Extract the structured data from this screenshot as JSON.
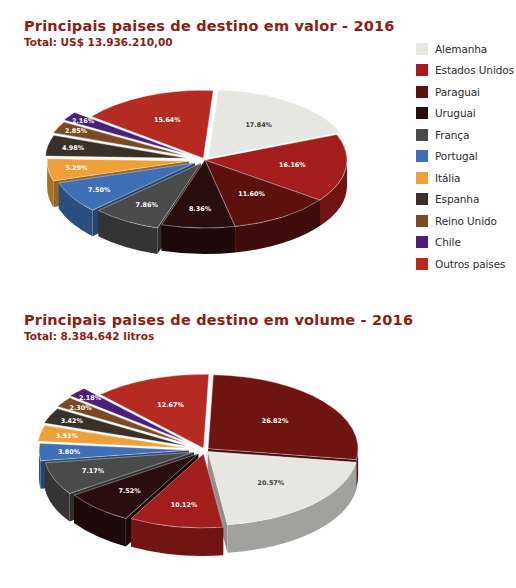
{
  "chart_data": [
    {
      "type": "pie",
      "title": "Principais paises de destino em valor - 2016",
      "subtitle": "Total: US$ 13.936.210,00",
      "legend_position": "right",
      "categories": [
        "Alemanha",
        "Estados Unidos",
        "Paraguai",
        "Uruguai",
        "França",
        "Portugal",
        "Itália",
        "Espanha",
        "Reino Unido",
        "Chile",
        "Outros paises"
      ],
      "values": [
        17.84,
        16.16,
        11.6,
        8.36,
        7.86,
        7.5,
        5.29,
        4.98,
        2.85,
        2.16,
        15.64
      ],
      "value_labels": [
        "17.84%",
        "16.16%",
        "11.60%",
        "8.36%",
        "7.86%",
        "7.50%",
        "5.29%",
        "4.98%",
        "2.85%",
        "2.16%",
        "15.64%"
      ],
      "colors": [
        "#e6e7e0",
        "#a41d1d",
        "#5c110f",
        "#2a0d0d",
        "#4a4a4a",
        "#3f6fb5",
        "#f0a038",
        "#3b3027",
        "#7a4a22",
        "#4b1f7a",
        "#b52b22"
      ],
      "xlabel": "",
      "ylabel": ""
    },
    {
      "type": "pie",
      "title": "Principais paises de destino em volume - 2016",
      "subtitle": "Total: 8.384.642 litros",
      "legend_position": "right",
      "categories": [
        "Alemanha",
        "Paraguai",
        "Estados Unidos",
        "Portugal",
        "França",
        "Espanha",
        "Itália",
        "Bolívia",
        "Chile",
        "Uruguai",
        "Outros paises"
      ],
      "values": [
        26.82,
        20.57,
        10.12,
        7.52,
        7.17,
        3.8,
        3.51,
        3.42,
        2.3,
        2.18,
        12.67
      ],
      "value_labels": [
        "26.82%",
        "20.57%",
        "10.12%",
        "7.52%",
        "7.17%",
        "3.80%",
        "3.51%",
        "3.42%",
        "2.30%",
        "2.18%",
        "12.67%"
      ],
      "colors": [
        "#6e1512",
        "#e6e7e0",
        "#a41d1d",
        "#2a0d0d",
        "#4a4a4a",
        "#3f6fb5",
        "#f0a038",
        "#3b3027",
        "#7a4a22",
        "#4b1f7a",
        "#b52b22"
      ],
      "xlabel": "",
      "ylabel": ""
    }
  ],
  "chart1": {
    "title": "Principais paises de destino em valor - 2016",
    "subtitle": "Total: US$ 13.936.210,00",
    "legend": [
      {
        "label": "Alemanha",
        "color": "#e6e7e0"
      },
      {
        "label": "Estados Unidos",
        "color": "#a41d1d"
      },
      {
        "label": "Paraguai",
        "color": "#5c110f"
      },
      {
        "label": "Uruguai",
        "color": "#2a0d0d"
      },
      {
        "label": "França",
        "color": "#4a4a4a"
      },
      {
        "label": "Portugal",
        "color": "#3f6fb5"
      },
      {
        "label": "Itália",
        "color": "#f0a038"
      },
      {
        "label": "Espanha",
        "color": "#3b3027"
      },
      {
        "label": "Reino Unido",
        "color": "#7a4a22"
      },
      {
        "label": "Chile",
        "color": "#4b1f7a"
      },
      {
        "label": "Outros paises",
        "color": "#b52b22"
      }
    ],
    "slices": [
      {
        "label": "17.84%"
      },
      {
        "label": "16.16%"
      },
      {
        "label": "11.60%"
      },
      {
        "label": "8.36%"
      },
      {
        "label": "7.86%"
      },
      {
        "label": "7.50%"
      },
      {
        "label": "5.29%"
      },
      {
        "label": "4.98%"
      },
      {
        "label": "2.85%"
      },
      {
        "label": "2.16%"
      },
      {
        "label": "15.64%"
      }
    ]
  },
  "chart2": {
    "title": "Principais paises de destino em volume - 2016",
    "subtitle": "Total: 8.384.642 litros",
    "legend": [
      {
        "label": "Alemanha",
        "color": "#6e1512"
      },
      {
        "label": "Paraguai",
        "color": "#e6e7e0"
      },
      {
        "label": "Estados Unidos",
        "color": "#a41d1d"
      },
      {
        "label": "Portugal",
        "color": "#2a0d0d"
      },
      {
        "label": "França",
        "color": "#4a4a4a"
      },
      {
        "label": "Espanha",
        "color": "#3f6fb5"
      },
      {
        "label": "Itália",
        "color": "#f0a038"
      },
      {
        "label": "Bolívia",
        "color": "#3b3027"
      },
      {
        "label": "Chile",
        "color": "#7a4a22"
      },
      {
        "label": "Uruguai",
        "color": "#4b1f7a"
      },
      {
        "label": "Outros paises",
        "color": "#b52b22"
      }
    ],
    "slices": [
      {
        "label": "26.82%"
      },
      {
        "label": "20.57%"
      },
      {
        "label": "10.12%"
      },
      {
        "label": "7.52%"
      },
      {
        "label": "7.17%"
      },
      {
        "label": "3.80%"
      },
      {
        "label": "3.51%"
      },
      {
        "label": "3.42%"
      },
      {
        "label": "2.30%"
      },
      {
        "label": "2.18%"
      },
      {
        "label": "12.67%"
      }
    ]
  }
}
